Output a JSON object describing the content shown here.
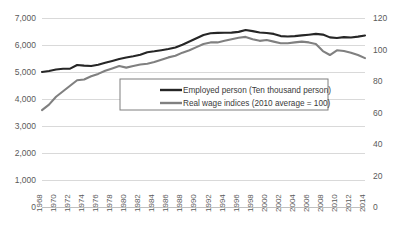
{
  "chart_data": {
    "type": "line",
    "title": "",
    "xlabel": "",
    "ylabel": "",
    "grid": true,
    "legend_position": "inside-center",
    "x": [
      1968,
      1969,
      1970,
      1971,
      1972,
      1973,
      1974,
      1975,
      1976,
      1977,
      1978,
      1979,
      1980,
      1981,
      1982,
      1983,
      1984,
      1985,
      1986,
      1987,
      1988,
      1989,
      1990,
      1991,
      1992,
      1993,
      1994,
      1995,
      1996,
      1997,
      1998,
      1999,
      2000,
      2001,
      2002,
      2003,
      2004,
      2005,
      2006,
      2007,
      2008,
      2009,
      2010,
      2011,
      2012,
      2013,
      2014
    ],
    "xtick_labels": [
      "1968",
      "1970",
      "1972",
      "1974",
      "1976",
      "1978",
      "1980",
      "1982",
      "1984",
      "1986",
      "1988",
      "1990",
      "1992",
      "1994",
      "1996",
      "1998",
      "2000",
      "2002",
      "2004",
      "2006",
      "2008",
      "2010",
      "2012",
      "2014"
    ],
    "left_axis": {
      "ylim": [
        0,
        7000
      ],
      "ticks": [
        "0",
        "1,000",
        "2,000",
        "3,000",
        "4,000",
        "5,000",
        "6,000",
        "7,000"
      ],
      "tick_values": [
        0,
        1000,
        2000,
        3000,
        4000,
        5000,
        6000,
        7000
      ]
    },
    "right_axis": {
      "ylim": [
        0,
        120
      ],
      "ticks": [
        "0",
        "20",
        "40",
        "60",
        "80",
        "100",
        "120"
      ],
      "tick_values": [
        0,
        20,
        40,
        60,
        80,
        100,
        120
      ]
    },
    "series": [
      {
        "name": "Employed person (Ten thousand person)",
        "axis": "left",
        "color": "#262626",
        "values": [
          5002,
          5040,
          5094,
          5121,
          5126,
          5259,
          5237,
          5223,
          5271,
          5342,
          5408,
          5479,
          5536,
          5581,
          5638,
          5733,
          5766,
          5807,
          5853,
          5911,
          6011,
          6128,
          6249,
          6369,
          6436,
          6450,
          6453,
          6457,
          6486,
          6557,
          6514,
          6462,
          6446,
          6412,
          6330,
          6316,
          6329,
          6356,
          6382,
          6412,
          6385,
          6282,
          6257,
          6293,
          6280,
          6311,
          6351
        ]
      },
      {
        "name": "Real wage indices (2010 average = 100)",
        "axis": "right",
        "color": "#808080",
        "values": [
          61.5,
          65.0,
          70.0,
          73.5,
          77.0,
          80.5,
          81.0,
          83.0,
          84.5,
          86.5,
          88.0,
          89.5,
          88.5,
          89.5,
          90.5,
          91.0,
          92.0,
          93.5,
          95.0,
          96.0,
          98.0,
          99.5,
          101.5,
          103.5,
          104.5,
          104.5,
          105.5,
          106.5,
          107.5,
          108.0,
          106.5,
          105.5,
          106.0,
          105.0,
          104.0,
          104.0,
          104.5,
          105.0,
          104.5,
          103.5,
          99.0,
          96.5,
          99.5,
          99.0,
          98.0,
          96.5,
          94.5
        ]
      }
    ]
  },
  "legend": {
    "items": [
      {
        "label": "Employed person (Ten thousand person)",
        "color": "#262626"
      },
      {
        "label": "Real wage indices (2010 average = 100)",
        "color": "#808080"
      }
    ]
  }
}
